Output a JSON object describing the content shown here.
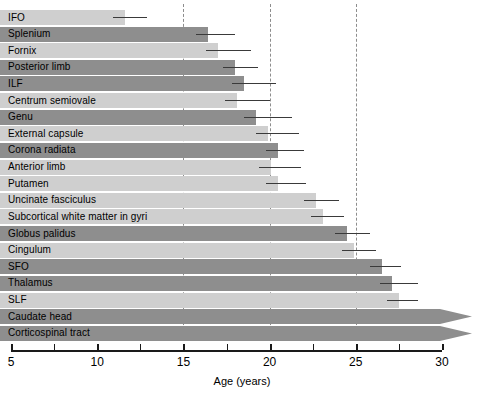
{
  "chart_data": {
    "type": "bar",
    "title": "",
    "subtitle": "",
    "xlabel": "Age (years)",
    "ylabel": "",
    "orientation": "horizontal",
    "xlim": [
      5,
      30
    ],
    "xticks": [
      5,
      10,
      15,
      20,
      25,
      30
    ],
    "xtick_labels": [
      "5",
      "10",
      "15",
      "20",
      "25",
      "30"
    ],
    "minor_xticks": [
      7.5,
      12.5,
      17.5,
      22.5,
      27.5
    ],
    "grid": "vertical dashed reference lines at 15, 20, 25",
    "gridlines": [
      15,
      20,
      25
    ],
    "legend": "none",
    "bar_start": 5,
    "categories": [
      "IFO",
      "Splenium",
      "Fornix",
      "Posterior limb",
      "ILF",
      "Centrum semiovale",
      "Genu",
      "External capsule",
      "Corona radiata",
      "Anterior limb",
      "Putamen",
      "Uncinate fasciculus",
      "Subcortical white matter in gyri",
      "Globus palidus",
      "Cingulum",
      "SFO",
      "Thalamus",
      "SLF",
      "Caudate head",
      "Corticospinal tract"
    ],
    "values": [
      11.6,
      16.4,
      17.0,
      18.0,
      18.5,
      18.1,
      19.2,
      19.9,
      20.5,
      20.1,
      20.5,
      22.7,
      23.1,
      24.5,
      24.9,
      26.5,
      27.1,
      27.5,
      30.0,
      30.0
    ],
    "error_upper": [
      12.9,
      18.0,
      18.9,
      19.3,
      20.4,
      20.0,
      21.3,
      21.7,
      22.0,
      21.8,
      22.1,
      24.0,
      24.3,
      25.8,
      26.2,
      27.6,
      28.6,
      28.6,
      30.0,
      30.0
    ],
    "shading": [
      "light",
      "dark",
      "light",
      "dark",
      "dark",
      "light",
      "dark",
      "light",
      "dark",
      "light",
      "light",
      "light",
      "light",
      "dark",
      "light",
      "dark",
      "dark",
      "light",
      "dark",
      "dark"
    ],
    "truncated_arrow": [
      false,
      false,
      false,
      false,
      false,
      false,
      false,
      false,
      false,
      false,
      false,
      false,
      false,
      false,
      false,
      false,
      false,
      false,
      true,
      true
    ]
  }
}
